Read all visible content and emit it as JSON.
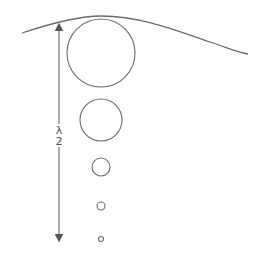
{
  "diagram": {
    "colors": {
      "stroke": "#6b6b6b",
      "text": "#4a4a4a",
      "background": "#ffffff"
    },
    "surface_curve": {
      "path": "M 22 33 C 55 22, 80 16, 101 16 C 140 16, 175 30, 210 42 C 228 48, 238 53, 248 54"
    },
    "dimension_arrow": {
      "x": 59,
      "top": 24,
      "bottom": 241,
      "gap_top": 124,
      "gap_bottom": 147,
      "label_numerator": "λ",
      "label_denominator": "2"
    },
    "bubbles": [
      {
        "cx": 101,
        "cy": 53,
        "r": 34
      },
      {
        "cx": 101,
        "cy": 120,
        "r": 21
      },
      {
        "cx": 101,
        "cy": 167,
        "r": 9
      },
      {
        "cx": 101,
        "cy": 206,
        "r": 4
      },
      {
        "cx": 101,
        "cy": 239,
        "r": 2.5
      }
    ]
  }
}
